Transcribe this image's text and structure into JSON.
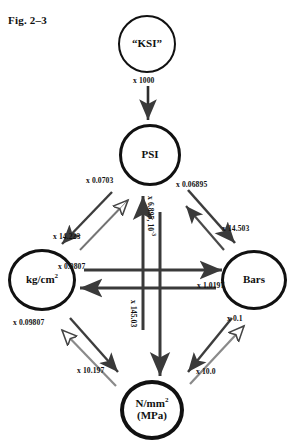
{
  "figure": {
    "caption": "Fig. 2–3"
  },
  "nodes": {
    "ksi": {
      "label": "“KSI”"
    },
    "psi": {
      "label": "PSI"
    },
    "kgcm": {
      "label": "kg/cm",
      "sup": "2"
    },
    "bars": {
      "label": "Bars"
    },
    "nmm": {
      "label": "N/mm",
      "sup": "2",
      "line2": "(MPa)"
    }
  },
  "multipliers": {
    "ksi_to_psi": "x 1000",
    "psi_to_kgcm": "x 0.0703",
    "kgcm_to_psi": "x 14.223",
    "psi_to_bars": "x 0.06895",
    "bars_to_psi": "x 14.503",
    "psi_to_nmm": "x 6.895, 10",
    "psi_to_nmm_exp": "-3",
    "nmm_to_psi": "x 145.03",
    "bars_to_kgcm": "x 1.0197",
    "kgcm_to_bars": "x 0.9807",
    "kgcm_to_nmm": "x 0.09807",
    "nmm_to_kgcm": "x 10.197",
    "bars_to_nmm": "x 0.1",
    "nmm_to_bars": "x 10.0"
  },
  "style": {
    "ink": "#111111",
    "paper": "#ffffff"
  }
}
